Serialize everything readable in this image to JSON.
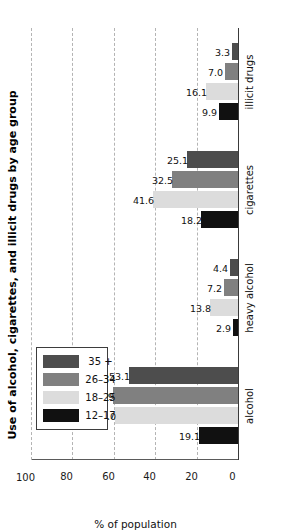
{
  "chart_data": {
    "type": "bar",
    "orientation": "vertical",
    "title": "Use of alcohol, cigarettes, and illicit drugs by age group",
    "xlabel": "",
    "ylabel": "% of population",
    "categories": [
      "alcohol",
      "heavy alcohol",
      "cigarettes",
      "illicit drugs"
    ],
    "series": [
      {
        "name": "12–17",
        "color": "#111111",
        "values": [
          19.1,
          2.9,
          18.2,
          9.9
        ]
      },
      {
        "name": "18–25",
        "color": "#dcdcdc",
        "values": [
          60.0,
          13.8,
          41.6,
          16.1
        ]
      },
      {
        "name": "26–34",
        "color": "#808080",
        "values": [
          60.9,
          7.2,
          32.5,
          7.0
        ]
      },
      {
        "name": "35 +",
        "color": "#4d4d4d",
        "values": [
          53.1,
          4.4,
          25.1,
          3.3
        ]
      }
    ],
    "ylim": [
      0,
      100
    ],
    "yticks": [
      0,
      20,
      40,
      60,
      80,
      100
    ],
    "ytick_labels": [
      "0",
      "20",
      "40",
      "60",
      "80",
      "100"
    ],
    "grid": true,
    "grid_style": "dashed",
    "legend_position": "top-left",
    "value_labels": true,
    "value_label_format": "one-decimal"
  },
  "legend": {
    "entries": [
      {
        "label": "12–17",
        "color": "#111111"
      },
      {
        "label": "18–25",
        "color": "#dcdcdc"
      },
      {
        "label": "26–34",
        "color": "#808080"
      },
      {
        "label": "35 +",
        "color": "#4d4d4d"
      }
    ]
  }
}
